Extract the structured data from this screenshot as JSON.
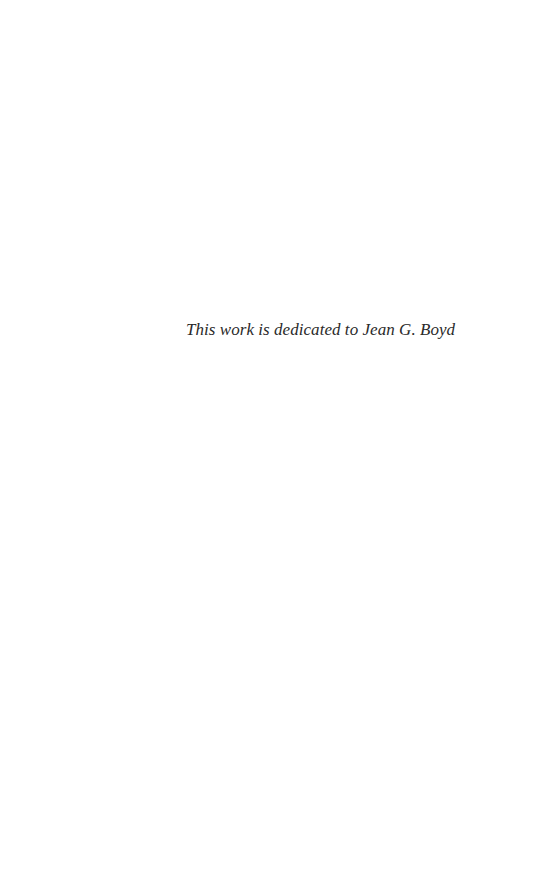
{
  "page": {
    "type": "dedication",
    "text": "This work is dedicated to Jean G. Boyd",
    "colors": {
      "background": "#ffffff",
      "text": "#2a2a2a"
    }
  }
}
